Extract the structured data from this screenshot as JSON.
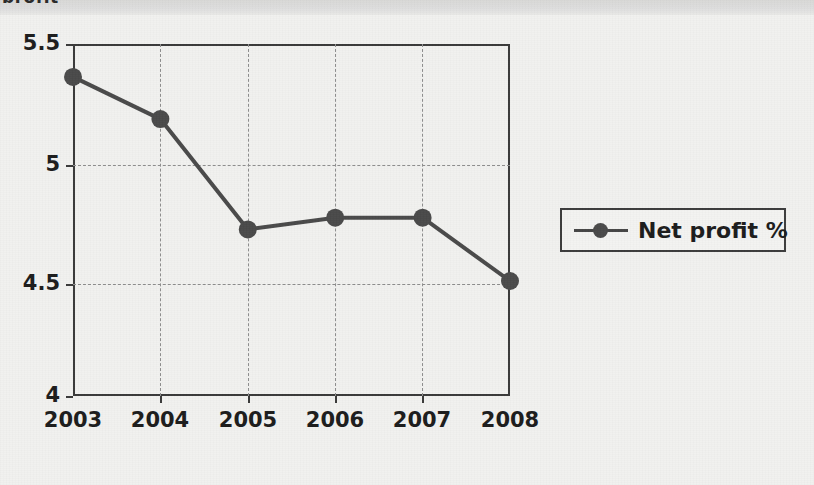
{
  "page": {
    "cropped_heading_text": "profit",
    "background_color": "#f1f1ef",
    "top_band_color": "#dcdcda"
  },
  "legend": {
    "label": "Net profit %",
    "marker_icon": "line-with-dot-marker",
    "position": "right-middle",
    "border_color": "#3d3d3d"
  },
  "chart_data": {
    "type": "line",
    "title": "",
    "subtitle": "",
    "xlabel": "",
    "ylabel": "",
    "categories": [
      "2003",
      "2004",
      "2005",
      "2006",
      "2007",
      "2008"
    ],
    "series": [
      {
        "name": "Net profit %",
        "values": [
          5.36,
          5.18,
          4.71,
          4.76,
          4.76,
          4.49
        ],
        "color": "#4a4a4a",
        "marker": "circle"
      }
    ],
    "ylim": [
      4,
      5.5
    ],
    "ytick_labels": [
      "5.5",
      "5",
      "4.5",
      "4"
    ],
    "ytick_values": [
      5.5,
      5,
      4.5,
      4
    ],
    "xtick_labels": [
      "2003",
      "2004",
      "2005",
      "2006",
      "2007",
      "2008"
    ],
    "grid": {
      "horizontal": true,
      "vertical": true,
      "style": "dashed",
      "color": "#8d8d8d"
    },
    "legend": {
      "visible": true,
      "position": "right",
      "entries": [
        "Net profit %"
      ]
    },
    "axis_color": "#3a3a3a"
  },
  "axis": {
    "y_labels": [
      {
        "text": "5.5",
        "value": 5.5
      },
      {
        "text": "5",
        "value": 5
      },
      {
        "text": "4.5",
        "value": 4.5
      },
      {
        "text": "4",
        "value": 4
      }
    ],
    "x_labels": [
      {
        "text": "2003"
      },
      {
        "text": "2004"
      },
      {
        "text": "2005"
      },
      {
        "text": "2006"
      },
      {
        "text": "2007"
      },
      {
        "text": "2008"
      }
    ]
  }
}
